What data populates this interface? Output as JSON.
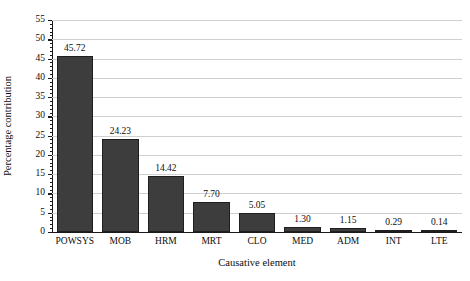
{
  "chart_data": {
    "type": "bar",
    "title": "",
    "subtitle": "",
    "categories": [
      "POWSYS",
      "MOB",
      "HRM",
      "MRT",
      "CLO",
      "MED",
      "ADM",
      "INT",
      "LTE"
    ],
    "values": [
      45.72,
      24.23,
      14.42,
      7.7,
      5.05,
      1.3,
      1.15,
      0.29,
      0.14
    ],
    "data_labels": [
      "45.72",
      "24.23",
      "14.42",
      "7.70",
      "5.05",
      "1.30",
      "1.15",
      "0.29",
      "0.14"
    ],
    "xlabel": "Causative element",
    "ylabel": "Percentage contribution",
    "ylim": [
      0,
      55
    ],
    "ytick_labels": [
      "0",
      "5",
      "10",
      "15",
      "20",
      "25",
      "30",
      "35",
      "40",
      "45",
      "50",
      "55"
    ],
    "ytick_values": [
      0,
      5,
      10,
      15,
      20,
      25,
      30,
      35,
      40,
      45,
      50,
      55
    ],
    "ytick_minor_step": 1,
    "grid": "horizontal",
    "legend": "none",
    "bar_color": "#3d3d3d",
    "bar_edge_color": "#1f1f1f",
    "grid_color": "#cfcfcf",
    "axis_color": "#1a1a1a",
    "background_color": "#ffffff"
  }
}
